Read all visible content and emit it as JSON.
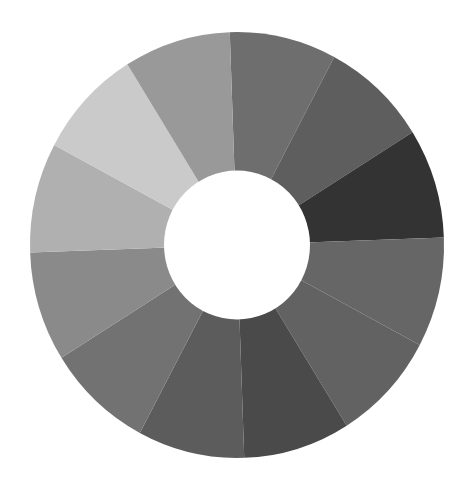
{
  "wheel": {
    "type": "segmented-ring",
    "segment_count": 12,
    "center": [
      237,
      245
    ],
    "outer_radius": [
      207,
      213
    ],
    "inner_radius": 73,
    "start_angle_deg": -92,
    "sweep_deg": 30,
    "background": "#ffffff",
    "hole_color": "#ffffff",
    "segments": [
      {
        "index": 1,
        "color": "#6e6e6e"
      },
      {
        "index": 2,
        "color": "#5e5e5e"
      },
      {
        "index": 3,
        "color": "#333333"
      },
      {
        "index": 4,
        "color": "#666666"
      },
      {
        "index": 5,
        "color": "#626262"
      },
      {
        "index": 6,
        "color": "#4a4a4a"
      },
      {
        "index": 7,
        "color": "#5c5c5c"
      },
      {
        "index": 8,
        "color": "#727272"
      },
      {
        "index": 9,
        "color": "#8a8a8a"
      },
      {
        "index": 10,
        "color": "#b0b0b0"
      },
      {
        "index": 11,
        "color": "#cacaca"
      },
      {
        "index": 12,
        "color": "#999999"
      }
    ]
  }
}
